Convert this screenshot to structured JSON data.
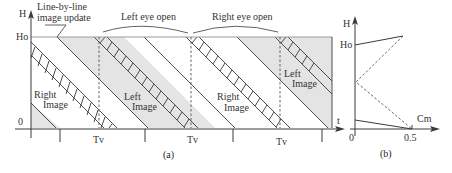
{
  "figure": {
    "panel_a": {
      "caption": "(a)",
      "y_axis_label": "H",
      "y_ticks": [
        "Ho",
        "0"
      ],
      "x_axis_label": "t",
      "annotation": [
        "Line-by-line",
        "image update"
      ],
      "brace_labels": [
        "Left eye open",
        "Right eye open"
      ],
      "period_labels": [
        "Tv",
        "Tv",
        "Tv"
      ],
      "region_labels": [
        {
          "line1": "Right",
          "line2": "Image"
        },
        {
          "line1": "Left",
          "line2": "Image"
        },
        {
          "line1": "Right",
          "line2": "Image"
        },
        {
          "line1": "Left",
          "line2": "Image"
        }
      ]
    },
    "panel_b": {
      "caption": "(b)",
      "y_axis_label": "H",
      "y_ticks": [
        "Ho"
      ],
      "x_axis_label": "Cm",
      "x_ticks": [
        "0",
        "0.5"
      ]
    },
    "colors": {
      "shade": "#e4e4e4",
      "line": "#3a3a3a",
      "text": "#333333"
    }
  }
}
